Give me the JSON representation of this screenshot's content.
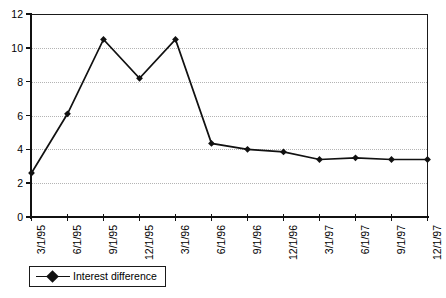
{
  "chart_data": {
    "type": "line",
    "title": "",
    "xlabel": "",
    "ylabel": "",
    "categories": [
      "3/1/95",
      "6/1/95",
      "9/1/95",
      "12/1/95",
      "3/1/96",
      "6/1/96",
      "9/1/96",
      "12/1/96",
      "3/1/97",
      "6/1/97",
      "9/1/97",
      "12/1/97"
    ],
    "series": [
      {
        "name": "Interest difference",
        "values": [
          2.6,
          6.1,
          10.5,
          8.2,
          10.5,
          4.35,
          4.0,
          3.85,
          3.4,
          3.5,
          3.4,
          3.4
        ],
        "marker": "diamond",
        "color": "#111111"
      }
    ],
    "ylim": [
      0,
      12
    ],
    "yticks": [
      0,
      2,
      4,
      6,
      8,
      10,
      12
    ],
    "ytick_labels": [
      "0",
      "2",
      "4",
      "6",
      "8",
      "10",
      "12"
    ],
    "grid": true,
    "grid_axis": "y",
    "grid_color": "#b4b4b4",
    "legend_position": "bottom-left",
    "legend_entries": [
      "Interest difference"
    ],
    "xlabel_rotation": -90
  },
  "legend": {
    "entry_label": "Interest difference"
  }
}
